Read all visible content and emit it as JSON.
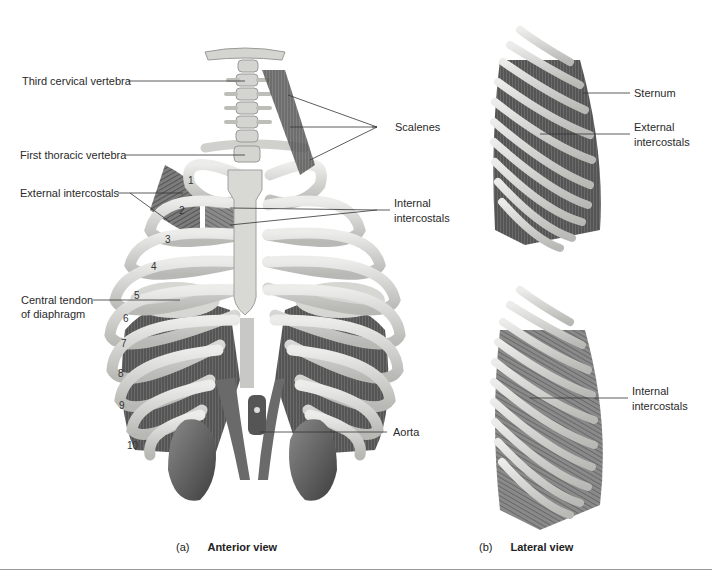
{
  "figure": {
    "panel_a": {
      "letter": "(a)",
      "title": "Anterior view",
      "labels": {
        "third_cervical": "Third cervical vertebra",
        "first_thoracic": "First thoracic vertebra",
        "external_intercostals": "External intercostals",
        "central_tendon_1": "Central tendon",
        "central_tendon_2": "of diaphragm",
        "scalenes": "Scalenes",
        "internal_intercostals_1": "Internal",
        "internal_intercostals_2": "intercostals",
        "aorta": "Aorta"
      },
      "rib_numbers": [
        "1",
        "2",
        "3",
        "4",
        "5",
        "6",
        "7",
        "8",
        "9",
        "10"
      ]
    },
    "panel_b": {
      "letter": "(b)",
      "title": "Lateral view",
      "labels": {
        "sternum": "Sternum",
        "external_1": "External",
        "external_2": "intercostals",
        "internal_1": "Internal",
        "internal_2": "intercostals"
      }
    },
    "colors": {
      "bone": "#d9d9d6",
      "bone_shadow": "#a9a9a6",
      "muscle": "#6e6e6e",
      "organ": "#5a5a5a",
      "leader": "#333333"
    }
  }
}
